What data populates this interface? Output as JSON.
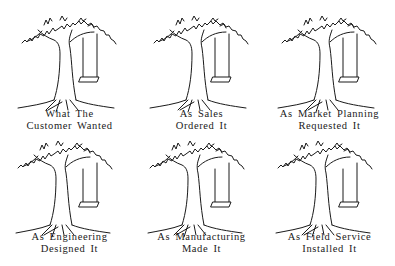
{
  "panels": [
    {
      "line1": "What The",
      "line2": "Customer Wanted"
    },
    {
      "line1": "As Sales",
      "line2": "Ordered It"
    },
    {
      "line1": "As Market Planning",
      "line2": "Requested It"
    },
    {
      "line1": "As Engineering",
      "line2": "Designed It"
    },
    {
      "line1": "As Manufacturing",
      "line2": "Made It"
    },
    {
      "line1": "As Field Service",
      "line2": "Installed It"
    }
  ],
  "colors": {
    "ink": "#1a1a1a",
    "background": "#ffffff"
  }
}
